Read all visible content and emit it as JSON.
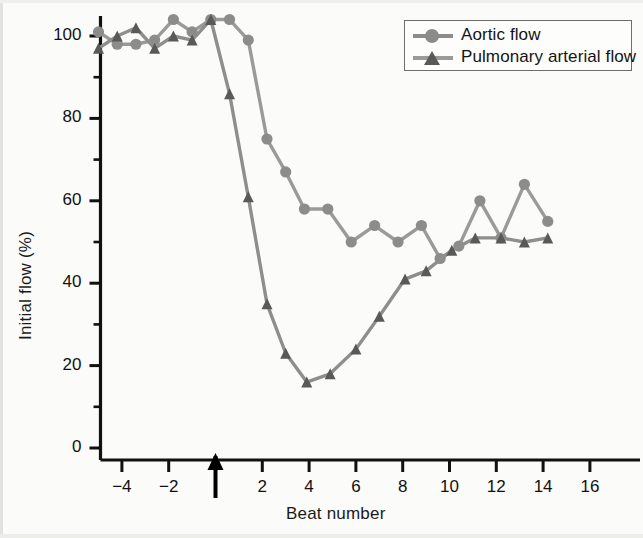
{
  "figure": {
    "background": "#fbfbf9",
    "axis_color": "#111111"
  },
  "chart_data": {
    "type": "line",
    "title": "",
    "xlabel": "Beat number",
    "ylabel": "Initial flow (%)",
    "xlim": [
      -5.2,
      17.0
    ],
    "ylim": [
      0,
      108
    ],
    "xticks": [
      -4,
      -2,
      0,
      2,
      4,
      6,
      8,
      10,
      12,
      14,
      16
    ],
    "xtick_labels": [
      "−4",
      "−2",
      "",
      "2",
      "4",
      "6",
      "8",
      "10",
      "12",
      "14",
      "16"
    ],
    "yticks": [
      0,
      20,
      40,
      60,
      80,
      100
    ],
    "ytick_labels": [
      "0",
      "20",
      "40",
      "60",
      "80",
      "100"
    ],
    "y_minor_ticks": [
      10,
      30,
      50,
      70,
      90
    ],
    "grid": false,
    "legend_position": "top-right",
    "annotations": [
      {
        "name": "intervention-arrow",
        "x": 0,
        "type": "up-arrow-on-x-axis",
        "label": ""
      }
    ],
    "series": [
      {
        "name": "Aortic flow",
        "marker": "circle",
        "color": "#8c8c8c",
        "line_color": "#9a9a9a",
        "x": [
          -5.0,
          -4.2,
          -3.4,
          -2.6,
          -1.8,
          -1.0,
          -0.2,
          0.6,
          1.4,
          2.2,
          3.0,
          3.8,
          4.8,
          5.8,
          6.8,
          7.8,
          8.8,
          9.6,
          10.4,
          11.3,
          12.2,
          13.2,
          14.2
        ],
        "y": [
          101,
          98,
          98,
          99,
          104,
          101,
          104,
          104,
          99,
          75,
          67,
          58,
          58,
          50,
          54,
          50,
          54,
          46,
          49,
          60,
          51,
          64,
          55
        ]
      },
      {
        "name": "Pulmonary arterial flow",
        "marker": "triangle",
        "color": "#595959",
        "line_color": "#8e8e8e",
        "x": [
          -5.0,
          -4.2,
          -3.4,
          -2.6,
          -1.8,
          -1.0,
          -0.2,
          0.6,
          1.4,
          2.2,
          3.0,
          3.9,
          4.9,
          6.0,
          7.0,
          8.1,
          9.0,
          10.1,
          11.1,
          12.2,
          13.2,
          14.2
        ],
        "y": [
          97,
          100,
          102,
          97,
          100,
          99,
          104,
          86,
          61,
          35,
          23,
          16,
          18,
          24,
          32,
          41,
          43,
          48,
          51,
          51,
          50,
          51
        ]
      }
    ]
  },
  "legend": {
    "entries": [
      {
        "label": "Aortic flow",
        "marker": "circle",
        "color": "#8c8c8c"
      },
      {
        "label": "Pulmonary arterial flow",
        "marker": "triangle",
        "color": "#595959"
      }
    ]
  }
}
